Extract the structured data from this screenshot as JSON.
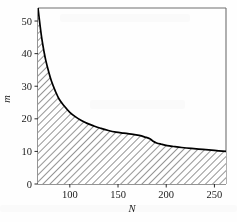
{
  "chart_data": {
    "type": "area",
    "title": "",
    "subtitle": "",
    "xlabel": "N",
    "ylabel": "m",
    "xlim": [
      67,
      262
    ],
    "ylim": [
      0,
      54
    ],
    "xticks": [
      100,
      150,
      200,
      250
    ],
    "yticks": [
      0,
      10,
      20,
      30,
      40,
      50
    ],
    "xticklabels": [
      "100",
      "150",
      "200",
      "250"
    ],
    "yticklabels": [
      "0",
      "10",
      "20",
      "30",
      "40",
      "50"
    ],
    "grid": false,
    "legend": null,
    "fill_style": "diagonal-hatch",
    "fill_description": "region under curve filled with diagonal hatch lines",
    "series": [
      {
        "name": "m(N)",
        "x": [
          67,
          69,
          71,
          73,
          75,
          78,
          81,
          85,
          89,
          94,
          100,
          106,
          112,
          118,
          125,
          132,
          140,
          148,
          156,
          164,
          172,
          178,
          183,
          186,
          190,
          195,
          201,
          208,
          216,
          226,
          238,
          250,
          262
        ],
        "y": [
          54.0,
          49.0,
          44.5,
          41.0,
          38.0,
          34.5,
          31.5,
          28.5,
          26.0,
          24.0,
          22.0,
          20.6,
          19.5,
          18.6,
          17.8,
          17.1,
          16.4,
          15.9,
          15.6,
          15.3,
          14.9,
          14.4,
          13.9,
          13.2,
          12.6,
          12.2,
          11.8,
          11.5,
          11.2,
          10.9,
          10.6,
          10.3,
          10.0
        ]
      }
    ],
    "annotations": []
  },
  "axis": {
    "x_title": "N",
    "y_title": "m"
  }
}
